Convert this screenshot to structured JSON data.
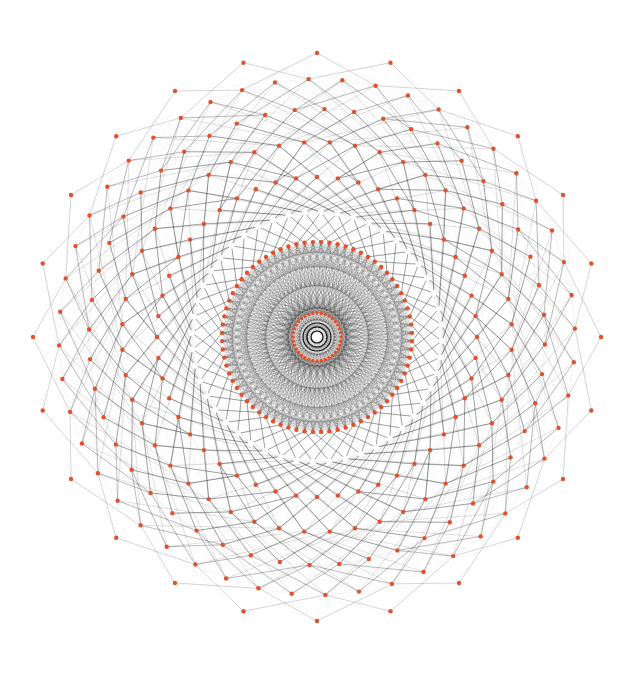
{
  "figure": {
    "type": "radial-network-graph",
    "width": 635,
    "height": 674,
    "background": "#ffffff",
    "center": {
      "x": 317,
      "y": 337
    },
    "colors": {
      "edge": "#1a1a1a",
      "edge_faint": "#9aa0a0",
      "node_red": "#e0522c",
      "node_white": "#ffffff",
      "center_node": "#ffffff"
    },
    "center_node": {
      "radius": 5
    },
    "rings": [
      {
        "name": "ring-1",
        "r": 24,
        "count": 36,
        "color": "#e0522c",
        "node_size": 1.8,
        "offset": 0
      },
      {
        "name": "ring-2",
        "r": 95,
        "count": 72,
        "color": "#e0522c",
        "node_size": 2.2,
        "offset": 0.5
      },
      {
        "name": "ring-3",
        "r": 125,
        "count": 48,
        "color": "#ffffff",
        "node_size": 3.0,
        "offset": 0.25
      },
      {
        "name": "ring-4",
        "r": 160,
        "count": 48,
        "color": "#e0522c",
        "node_size": 2.2,
        "offset": 0
      },
      {
        "name": "ring-5",
        "r": 195,
        "count": 48,
        "color": "#e0522c",
        "node_size": 2.2,
        "offset": 0.5
      },
      {
        "name": "ring-6",
        "r": 228,
        "count": 48,
        "color": "#e0522c",
        "node_size": 2.2,
        "offset": 0.25
      },
      {
        "name": "ring-7",
        "r": 258,
        "count": 48,
        "color": "#e0522c",
        "node_size": 2.2,
        "offset": 0.75
      },
      {
        "name": "ring-8",
        "r": 284,
        "count": 24,
        "color": "#e0522c",
        "node_size": 2.2,
        "offset": 0
      }
    ]
  }
}
